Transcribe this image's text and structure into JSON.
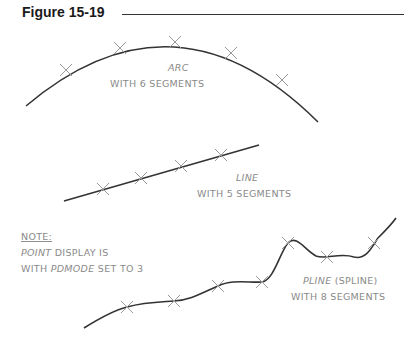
{
  "figure": {
    "title": "Figure 15-19",
    "arc": {
      "label_line1": "ARC",
      "label_line2": "WITH 6 SEGMENTS"
    },
    "line": {
      "label_line1": "LINE",
      "label_line2": "WITH 5 SEGMENTS"
    },
    "note": {
      "heading": "NOTE:",
      "line1_italic": "POINT",
      "line1_rest": " DISPLAY IS",
      "line2_start": "WITH ",
      "line2_italic": "PDMODE",
      "line2_rest": " SET TO 3"
    },
    "pline": {
      "label_italic": "PLINE",
      "label_rest": " (SPLINE)",
      "label_line2": "WITH 8 SEGMENTS"
    },
    "colors": {
      "curve": "#333333",
      "marker": "#9a9a9a",
      "label": "#8a8a8a"
    }
  }
}
